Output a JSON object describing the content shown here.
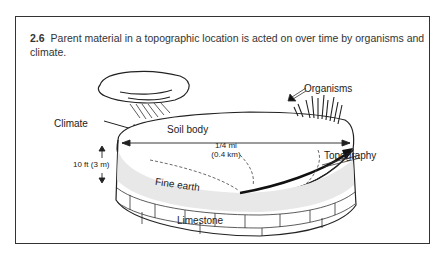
{
  "figure": {
    "number": "2.6",
    "caption": "Parent material in a topographic location is acted on over time by organisms and climate."
  },
  "labels": {
    "climate": "Climate",
    "soil_body": "Soil body",
    "distance_mi": "1/4 mi",
    "distance_km": "(0.4 km)",
    "organisms": "Organisms",
    "topography": "Topography",
    "depth": "10 ft (3 m)",
    "fine_earth": "Fine earth",
    "limestone": "Limestone"
  }
}
